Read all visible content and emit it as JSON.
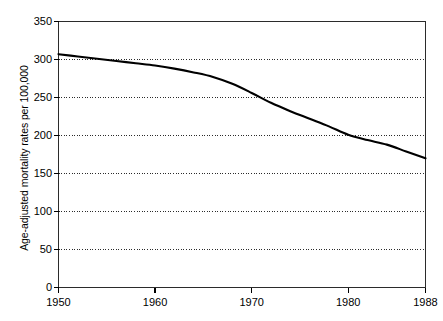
{
  "chart_data": {
    "type": "line",
    "title": "",
    "xlabel": "",
    "ylabel": "Age-adjusted mortality rates per 100,000",
    "xlim": [
      1950,
      1988
    ],
    "ylim": [
      0,
      350
    ],
    "grid": true,
    "legend": "none",
    "x_ticks": [
      1950,
      1960,
      1970,
      1980,
      1988
    ],
    "x_tick_labels": [
      "1950",
      "1960",
      "1970",
      "1980",
      "1988"
    ],
    "y_ticks": [
      0,
      50,
      100,
      150,
      200,
      250,
      300,
      350
    ],
    "y_tick_labels": [
      "0",
      "50",
      "100",
      "150",
      "200",
      "250",
      "300",
      "350"
    ],
    "series": [
      {
        "name": "Age-adjusted mortality rate",
        "color": "#000000",
        "x": [
          1950,
          1952,
          1954,
          1956,
          1958,
          1960,
          1962,
          1964,
          1966,
          1968,
          1970,
          1972,
          1974,
          1976,
          1978,
          1980,
          1982,
          1984,
          1986,
          1988
        ],
        "values": [
          307,
          304,
          301,
          298,
          295,
          292,
          288,
          283,
          277,
          268,
          256,
          243,
          232,
          222,
          212,
          201,
          194,
          188,
          179,
          170
        ]
      }
    ]
  },
  "axis": {
    "y_title": "Age-adjusted mortality rates per 100,000"
  }
}
